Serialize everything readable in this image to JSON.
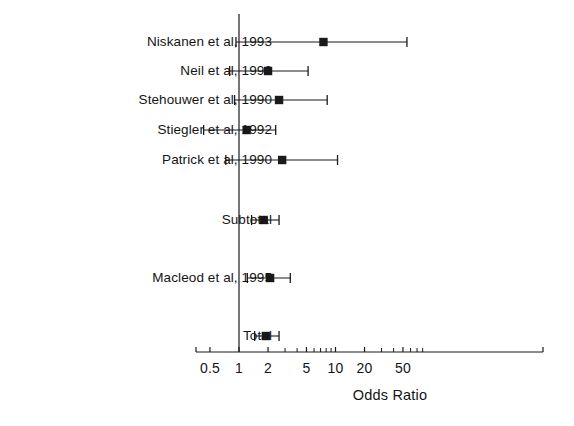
{
  "chart_data": {
    "type": "forest",
    "title": "",
    "xlabel": "Odds Ratio",
    "ylabel": "",
    "xscale": "log",
    "xlim": [
      0.42,
      90
    ],
    "grid": false,
    "legend": "none",
    "reference_line": 1,
    "xticks": [
      0.5,
      1,
      2,
      5,
      10,
      20,
      50
    ],
    "xticklabels": [
      "0.5",
      "1",
      "2",
      "5",
      "10",
      "20",
      "50"
    ],
    "minor_ticks": [
      3,
      4,
      6,
      7,
      8,
      9,
      30,
      40,
      60,
      70,
      80
    ],
    "rows": [
      {
        "label": "Niskanen et al, 1993",
        "or": 7.5,
        "ci_low": 0.93,
        "ci_high": 55.0,
        "y": 42
      },
      {
        "label": "Neil et al, 1993",
        "or": 2.0,
        "ci_low": 0.8,
        "ci_high": 5.2,
        "y": 71
      },
      {
        "label": "Stehouwer et al, 1990",
        "or": 2.6,
        "ci_low": 0.9,
        "ci_high": 8.2,
        "y": 100
      },
      {
        "label": "Stiegler et al, 1992",
        "or": 1.2,
        "ci_low": 0.43,
        "ci_high": 2.4,
        "y": 130
      },
      {
        "label": "Patrick et al, 1990",
        "or": 2.8,
        "ci_low": 0.73,
        "ci_high": 10.5,
        "y": 160
      },
      {
        "label": "Subtotal",
        "or": 1.8,
        "ci_low": 1.35,
        "ci_high": 2.6,
        "y": 220
      },
      {
        "label": "Macleod et al, 1995",
        "or": 2.1,
        "ci_low": 1.22,
        "ci_high": 3.4,
        "y": 278
      },
      {
        "label": "Total",
        "or": 1.9,
        "ci_low": 1.45,
        "ci_high": 2.6,
        "y": 336
      }
    ]
  },
  "axis": {
    "title": "Odds Ratio",
    "ticklabels": [
      "0.5",
      "1",
      "2",
      "5",
      "10",
      "20",
      "50"
    ]
  },
  "labels": [
    "Niskanen et al, 1993",
    "Neil et al, 1993",
    "Stehouwer et al, 1990",
    "Stiegler et al, 1992",
    "Patrick et al, 1990",
    "Subtotal",
    "Macleod et al, 1995",
    "Total"
  ],
  "colors": {
    "ink": "#1a1a1a",
    "background": "#ffffff"
  }
}
